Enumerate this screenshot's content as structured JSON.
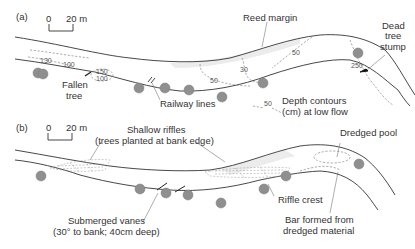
{
  "figure": {
    "panel_a": {
      "label": "(a)",
      "scale_bar": {
        "zero": "0",
        "end": "20 m"
      },
      "depth_labels": [
        "130",
        "100",
        "150",
        "100",
        "50",
        "30",
        "50",
        "250"
      ],
      "annotations": {
        "fallen_tree_1": "Fallen",
        "fallen_tree_2": "tree",
        "railway_lines": "Railway lines",
        "reed_margin": "Reed margin",
        "dead_tree_1": "Dead",
        "dead_tree_2": "tree",
        "dead_tree_3": "stump",
        "legend_sample": "50",
        "depth_legend_1": "Depth contours",
        "depth_legend_2": "(cm) at low flow"
      }
    },
    "panel_b": {
      "label": "(b)",
      "scale_bar": {
        "zero": "0",
        "end": "20 m"
      },
      "annotations": {
        "shallow_riffles_1": "Shallow riffles",
        "shallow_riffles_2": "(trees planted at bank edge)",
        "dredged_pool": "Dredged pool",
        "submerged_vanes_1": "Submerged vanes",
        "submerged_vanes_2": "(30° to bank; 40cm deep)",
        "riffle_crest": "Riffle crest",
        "bar_1": "Bar formed from",
        "bar_2": "dredged material"
      }
    },
    "colors": {
      "bank_line": "#333333",
      "tree_fill": "#8f8f8f",
      "contour": "#888888",
      "text": "#333333"
    }
  }
}
